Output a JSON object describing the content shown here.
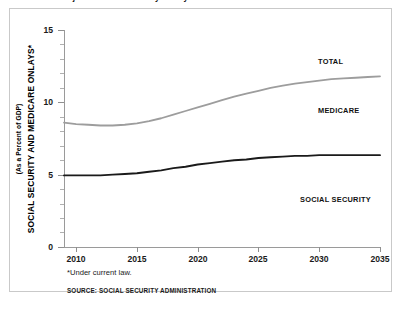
{
  "figure": {
    "title": "FIGURE 2-3. Projected Social Security Outlays Relative to GDP",
    "footnote": "*Under current law.",
    "source": "SOURCE: SOCIAL SECURITY ADMINISTRATION"
  },
  "axes": {
    "y_title": "SOCIAL SECURITY AND MEDICARE ONLAYS*",
    "y_subtitle": "(As a Percent of GDP)",
    "y_ticks": [
      "0",
      "5",
      "10",
      "15"
    ],
    "x_ticks": [
      "2010",
      "2015",
      "2020",
      "2025",
      "2030",
      "2035"
    ]
  },
  "series_labels": {
    "total": "TOTAL",
    "medicare": "MEDICARE",
    "social_security": "SOCIAL SECURITY"
  },
  "colors": {
    "total_line": "#9d9d9d",
    "social_security_line": "#1a1a1a",
    "frame": "#c9c9c9",
    "axis": "#9a9a9a",
    "background": "#ffffff"
  },
  "chart_data": {
    "type": "line",
    "title": "FIGURE 2-3. Projected Social Security Outlays Relative to GDP",
    "xlabel": "",
    "ylabel": "SOCIAL SECURITY AND MEDICARE ONLAYS* (As a Percent of GDP)",
    "xlim": [
      2009,
      2035
    ],
    "ylim": [
      0,
      15
    ],
    "ytick_values": [
      0,
      5,
      10,
      15
    ],
    "xtick_values": [
      2010,
      2015,
      2020,
      2025,
      2030,
      2035
    ],
    "grid": false,
    "legend_position": "inline-annotations",
    "annotations": [
      {
        "text": "TOTAL",
        "x": 2029,
        "y": 13.1
      },
      {
        "text": "MEDICARE",
        "x": 2029,
        "y": 9.7
      },
      {
        "text": "SOCIAL SECURITY",
        "x": 2026,
        "y": 3.6
      }
    ],
    "x": [
      2009,
      2010,
      2011,
      2012,
      2013,
      2014,
      2015,
      2016,
      2017,
      2018,
      2019,
      2020,
      2021,
      2022,
      2023,
      2024,
      2025,
      2026,
      2027,
      2028,
      2029,
      2030,
      2031,
      2032,
      2033,
      2034,
      2035
    ],
    "series": [
      {
        "name": "TOTAL",
        "color": "#9d9d9d",
        "values": [
          8.6,
          8.5,
          8.45,
          8.4,
          8.4,
          8.45,
          8.55,
          8.7,
          8.9,
          9.15,
          9.4,
          9.65,
          9.9,
          10.15,
          10.4,
          10.6,
          10.8,
          11.0,
          11.15,
          11.3,
          11.4,
          11.5,
          11.6,
          11.65,
          11.7,
          11.75,
          11.8
        ]
      },
      {
        "name": "SOCIAL SECURITY",
        "color": "#1a1a1a",
        "values": [
          4.95,
          4.95,
          4.95,
          4.95,
          5.0,
          5.05,
          5.1,
          5.2,
          5.3,
          5.45,
          5.55,
          5.7,
          5.8,
          5.9,
          6.0,
          6.05,
          6.15,
          6.2,
          6.25,
          6.3,
          6.3,
          6.35,
          6.35,
          6.35,
          6.35,
          6.35,
          6.35
        ]
      }
    ],
    "derived_series": [
      {
        "name": "MEDICARE",
        "note": "Difference between TOTAL and SOCIAL SECURITY (area between curves)",
        "values": [
          3.65,
          3.55,
          3.5,
          3.45,
          3.4,
          3.4,
          3.45,
          3.5,
          3.6,
          3.7,
          3.85,
          3.95,
          4.1,
          4.25,
          4.4,
          4.55,
          4.65,
          4.8,
          4.9,
          5.0,
          5.1,
          5.15,
          5.25,
          5.3,
          5.35,
          5.4,
          5.45
        ]
      }
    ]
  }
}
